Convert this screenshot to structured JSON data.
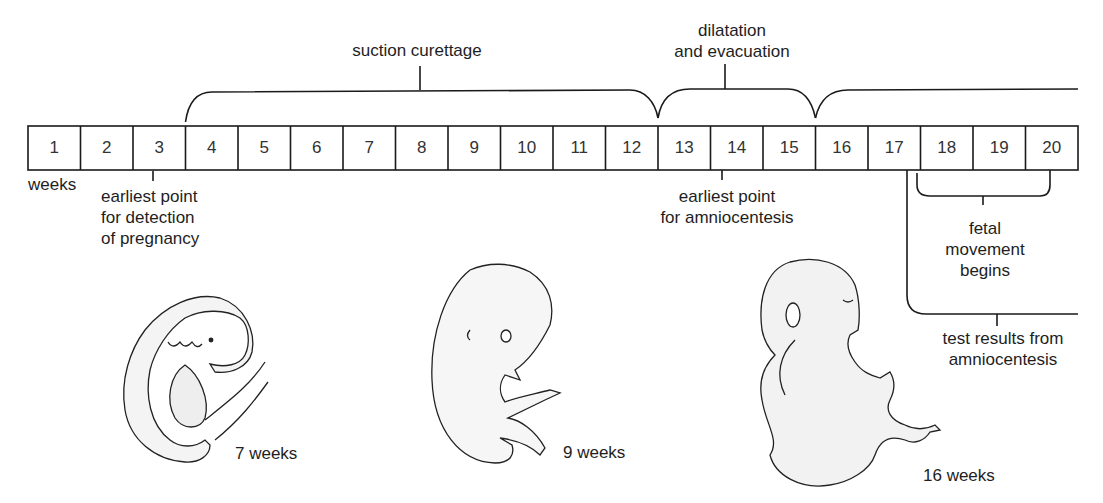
{
  "timeline": {
    "unit_label": "weeks",
    "weeks": [
      "1",
      "2",
      "3",
      "4",
      "5",
      "6",
      "7",
      "8",
      "9",
      "10",
      "11",
      "12",
      "13",
      "14",
      "15",
      "16",
      "17",
      "18",
      "19",
      "20"
    ]
  },
  "procedures": [
    {
      "label": "suction curettage",
      "from_week": 4,
      "to_week": 12
    },
    {
      "label_lines": [
        "dilatation",
        "and evacuation"
      ],
      "from_week": 13,
      "to_week": 15
    },
    {
      "label": "",
      "from_week": 16,
      "to_week": 20,
      "open_ended": true
    }
  ],
  "annotations": {
    "pregnancy_detection": [
      "earliest point",
      "for detection",
      "of pregnancy"
    ],
    "amniocentesis": [
      "earliest point",
      "for amniocentesis"
    ],
    "fetal_movement": [
      "fetal",
      "movement",
      "begins"
    ],
    "test_results": [
      "test results from",
      "amniocentesis"
    ]
  },
  "illustrations": [
    {
      "name": "embryo-7-weeks",
      "caption": "7 weeks"
    },
    {
      "name": "fetus-9-weeks",
      "caption": "9 weeks"
    },
    {
      "name": "fetus-16-weeks",
      "caption": "16 weeks"
    }
  ]
}
